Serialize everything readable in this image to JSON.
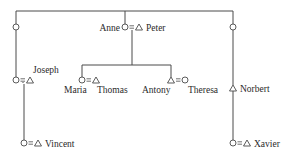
{
  "diagram": {
    "type": "kinship-chart",
    "legend_symbols": {
      "circle": "female",
      "triangle": "male",
      "equals": "marriage"
    },
    "people": {
      "anne": {
        "name": "Anne",
        "sex": "female"
      },
      "peter": {
        "name": "Peter",
        "sex": "male"
      },
      "joseph": {
        "name": "Joseph",
        "sex": "male"
      },
      "vincent": {
        "name": "Vincent",
        "sex": "male"
      },
      "maria": {
        "name": "Maria",
        "sex": "female"
      },
      "thomas": {
        "name": "Thomas",
        "sex": "male"
      },
      "antony": {
        "name": "Antony",
        "sex": "male"
      },
      "theresa": {
        "name": "Theresa",
        "sex": "female"
      },
      "norbert": {
        "name": "Norbert",
        "sex": "male"
      },
      "xavier": {
        "name": "Xavier",
        "sex": "male"
      }
    },
    "marriages": [
      {
        "wife": "Anne",
        "husband": "Peter"
      },
      {
        "wife": "(unnamed)",
        "husband": "Joseph"
      },
      {
        "wife": "(unnamed)",
        "husband": "Vincent"
      },
      {
        "wife": "Maria",
        "husband": "Thomas"
      },
      {
        "husband": "Antony",
        "wife": "Theresa"
      },
      {
        "wife": "(unnamed)",
        "husband": "Xavier"
      }
    ]
  }
}
